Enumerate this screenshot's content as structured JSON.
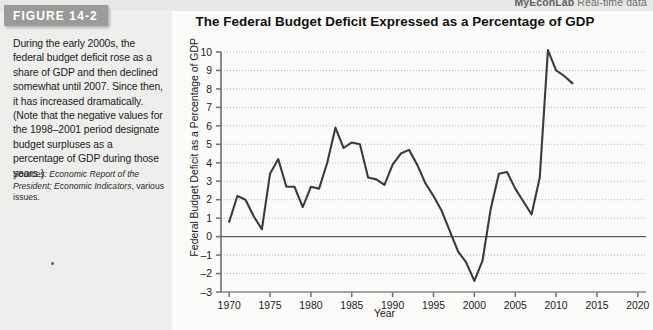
{
  "figure": {
    "banner_label": "FIGURE 14-2",
    "title": "The Federal Budget Deficit Expressed as a Percentage of GDP",
    "branding_prefix": "MyEconLab",
    "branding_suffix": "Real-time data",
    "caption": "During the early 2000s, the federal budget deficit rose as a share of GDP and then declined somewhat until 2007. Since then, it has increased dramatically. (Note that the negative values for the 1998–2001 period designate budget surpluses as a percentage of GDP during those years.)",
    "sources_label": "Sources:",
    "sources_italic": "Economic Report of the President;",
    "sources_italic2": "Economic Indicators",
    "sources_tail": ", various issues."
  },
  "colors": {
    "line": "#3b3b3b",
    "axis": "#6f6f6f",
    "grid": "#b9b9b9",
    "zero_line": "#5e5e5e",
    "banner": "#9a9a99",
    "panel_bg": "#fbfbfa",
    "caption_bg": "#eeeeec"
  },
  "chart_data": {
    "type": "line",
    "title": "The Federal Budget Deficit Expressed as a Percentage of GDP",
    "xlabel": "Year",
    "ylabel": "Federal Budget Deficit as a Percentage of GDP",
    "xlim": [
      1969,
      2021
    ],
    "ylim": [
      -3,
      10
    ],
    "xticks": [
      1970,
      1975,
      1980,
      1985,
      1990,
      1995,
      2000,
      2005,
      2010,
      2015,
      2020
    ],
    "yticks": [
      -3,
      -2,
      -1,
      0,
      1,
      2,
      3,
      4,
      5,
      6,
      7,
      8,
      9,
      10
    ],
    "grid": "horizontal-dotted",
    "legend": "none",
    "zero_reference_line": 0,
    "series": [
      {
        "name": "Federal budget deficit as a percentage of GDP",
        "x": [
          1970,
          1971,
          1972,
          1973,
          1974,
          1975,
          1976,
          1977,
          1978,
          1979,
          1980,
          1981,
          1982,
          1983,
          1984,
          1985,
          1986,
          1987,
          1988,
          1989,
          1990,
          1991,
          1992,
          1993,
          1994,
          1995,
          1996,
          1997,
          1998,
          1999,
          2000,
          2001,
          2002,
          2003,
          2004,
          2005,
          2006,
          2007,
          2008,
          2009,
          2010,
          2011,
          2012
        ],
        "values": [
          0.8,
          2.2,
          2.0,
          1.1,
          0.4,
          3.4,
          4.2,
          2.7,
          2.7,
          1.6,
          2.7,
          2.6,
          4.0,
          5.9,
          4.8,
          5.1,
          5.0,
          3.2,
          3.1,
          2.8,
          3.9,
          4.5,
          4.7,
          3.9,
          2.9,
          2.2,
          1.4,
          0.3,
          -0.8,
          -1.4,
          -2.4,
          -1.3,
          1.5,
          3.4,
          3.5,
          2.6,
          1.9,
          1.2,
          3.2,
          10.1,
          9.0,
          8.7,
          8.3
        ]
      }
    ]
  }
}
